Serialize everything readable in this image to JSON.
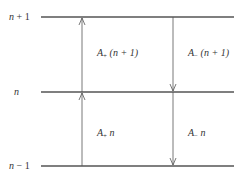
{
  "diagram": {
    "levels": [
      {
        "id": "upper",
        "label_var": "n",
        "label_suffix": " + 1",
        "y": 17
      },
      {
        "id": "middle",
        "label_var": "n",
        "label_suffix": "",
        "y": 92
      },
      {
        "id": "lower",
        "label_var": "n",
        "label_suffix": " − 1",
        "y": 166
      }
    ],
    "transitions": [
      {
        "id": "a-plus-n-plus-1",
        "symbol": "A",
        "sub": "+",
        "arg": "(n + 1)",
        "direction": "up",
        "from": "n",
        "to": "n+1"
      },
      {
        "id": "a-minus-n-plus-1",
        "symbol": "A",
        "sub": "−",
        "arg": "(n + 1)",
        "direction": "down",
        "from": "n+1",
        "to": "n"
      },
      {
        "id": "a-plus-n",
        "symbol": "A",
        "sub": "+",
        "arg": "n",
        "direction": "up",
        "from": "n-1",
        "to": "n"
      },
      {
        "id": "a-minus-n",
        "symbol": "A",
        "sub": "−",
        "arg": "n",
        "direction": "down",
        "from": "n",
        "to": "n-1"
      }
    ],
    "colors": {
      "line": "#555555",
      "text": "#333333",
      "background": "#ffffff"
    }
  }
}
